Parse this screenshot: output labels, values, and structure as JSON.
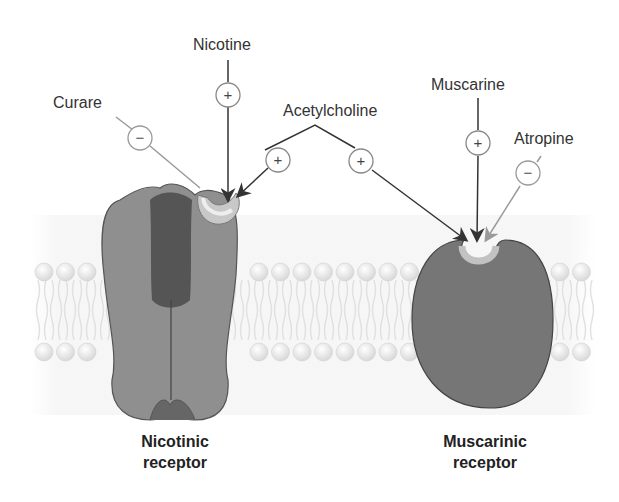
{
  "ligands": {
    "nicotine": {
      "label": "Nicotine",
      "effect": "+"
    },
    "curare": {
      "label": "Curare",
      "effect": "−"
    },
    "acetylcholine": {
      "label": "Acetylcholine",
      "effect_nicotinic": "+",
      "effect_muscarinic": "+"
    },
    "muscarine": {
      "label": "Muscarine",
      "effect": "+"
    },
    "atropine": {
      "label": "Atropine",
      "effect": "−"
    }
  },
  "receptors": {
    "nicotinic": {
      "line1": "Nicotinic",
      "line2": "receptor"
    },
    "muscarinic": {
      "line1": "Muscarinic",
      "line2": "receptor"
    }
  },
  "colors": {
    "agonist_arrow": "#333333",
    "antagonist_line": "#9a9a9a",
    "receptor_fill": "#8a8a8a",
    "membrane_head": "#eeeeee"
  }
}
